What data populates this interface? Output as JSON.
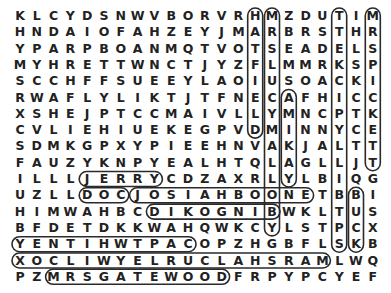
{
  "puzzle": {
    "type": "word-search",
    "rows": 17,
    "cols": 22,
    "grid": [
      "KLCYDSNWVBORVRHMZDUTIM",
      "HNDAIOFAHZEYJMARBRSTHR",
      "YPARPBOANMQTVOTSEADELS",
      "MYHRETTWNCTJYZFLMMRKSP",
      "SCCHFFSUEEYLAOIUSOACKI",
      "RWAFLYLIKTJTFNECAFHICC",
      "XSHEJPTCCMAIVLLYMNCPTK",
      "CVLIEHIUEKEGPVDMINNYCE",
      "SDMKGPXYPIEEHNVAKJALTT",
      "FAUZYKNPYEALHTQLAGLLJT",
      "ILLLJERRYCDZAXRLYLBIQG",
      "UZLLDOCJOSIAHBOONETBBI",
      "HIMWAHBCDIKOGNIBWKLTUS",
      "BFDETDKKWAHQWKCYLSTPCX",
      "YENTIHWTPACOPZHGBFLSKB",
      "XOCLIWYELRUCLAHSRAMLWQ",
      "PZMRSGATEWOODFRPYPCYEF"
    ],
    "found_words": [
      {
        "word": "JERRY",
        "start": [
          10,
          4
        ],
        "end": [
          10,
          8
        ]
      },
      {
        "word": "JOSIAH BOONE",
        "start": [
          11,
          7
        ],
        "end": [
          11,
          17
        ]
      },
      {
        "word": "DOC",
        "start": [
          11,
          4
        ],
        "end": [
          11,
          6
        ]
      },
      {
        "word": "BINGO KID",
        "start": [
          12,
          15
        ],
        "end": [
          12,
          8
        ]
      },
      {
        "word": "CAPT WHITNEY",
        "start": [
          14,
          10
        ],
        "end": [
          14,
          0
        ]
      },
      {
        "word": "MARSHAL CURLEY WILCOX",
        "start": [
          15,
          18
        ],
        "end": [
          15,
          0
        ]
      },
      {
        "word": "MRS GATEWOOD",
        "start": [
          16,
          2
        ],
        "end": [
          16,
          12
        ]
      },
      {
        "word": "MRS PICKETT",
        "start": [
          0,
          21
        ],
        "end": [
          9,
          21
        ]
      },
      {
        "word": "SPT BILLY PICKETT",
        "start": [
          14,
          19
        ],
        "end": [
          0,
          19
        ]
      },
      {
        "word": "BUCK",
        "start": [
          11,
          20
        ],
        "end": [
          14,
          20
        ]
      },
      {
        "word": "HATFIELD",
        "start": [
          0,
          14
        ],
        "end": [
          7,
          14
        ]
      },
      {
        "word": "MRS LUCY MALLORY",
        "start": [
          0,
          15
        ],
        "end": [
          13,
          15
        ]
      },
      {
        "word": "YAKIMA",
        "start": [
          10,
          16
        ],
        "end": [
          5,
          16
        ]
      }
    ]
  }
}
